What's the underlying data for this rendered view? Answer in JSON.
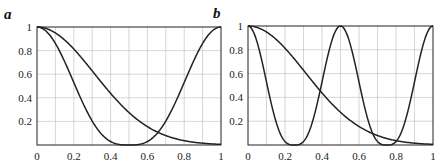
{
  "chart_data": [
    {
      "type": "line",
      "panel_label": "a",
      "xlim": [
        0,
        1
      ],
      "ylim": [
        0,
        1
      ],
      "xticks": [
        "0",
        "0.2",
        "0.4",
        "0.6",
        "0.8",
        "1"
      ],
      "yticks": [
        "0.2",
        "0.4",
        "0.6",
        "0.8",
        "1"
      ],
      "grid": true,
      "series": [
        {
          "name": "curve-gaussian",
          "x": [
            0,
            0.1,
            0.2,
            0.3,
            0.4,
            0.5,
            0.6,
            0.7,
            0.8,
            0.9,
            1.0
          ],
          "values": [
            1,
            0.95,
            0.81,
            0.63,
            0.44,
            0.27,
            0.16,
            0.08,
            0.04,
            0.02,
            0.01
          ]
        },
        {
          "name": "curve-periodic",
          "x": [
            0,
            0.1,
            0.2,
            0.3,
            0.4,
            0.5,
            0.6,
            0.7,
            0.8,
            0.9,
            1.0
          ],
          "values": [
            1,
            0.86,
            0.53,
            0.2,
            0.03,
            0,
            0.03,
            0.2,
            0.53,
            0.86,
            1
          ]
        }
      ]
    },
    {
      "type": "line",
      "panel_label": "b",
      "xlim": [
        0,
        1
      ],
      "ylim": [
        0,
        1
      ],
      "xticks": [
        "0",
        "0.2",
        "0.4",
        "0.6",
        "0.8",
        "1"
      ],
      "yticks": [
        "0.2",
        "0.4",
        "0.6",
        "0.8",
        "1"
      ],
      "grid": true,
      "series": [
        {
          "name": "curve-gaussian",
          "x": [
            0,
            0.1,
            0.2,
            0.3,
            0.4,
            0.5,
            0.6,
            0.7,
            0.8,
            0.9,
            1.0
          ],
          "values": [
            1,
            0.95,
            0.81,
            0.63,
            0.44,
            0.27,
            0.16,
            0.08,
            0.04,
            0.02,
            0.01
          ]
        },
        {
          "name": "curve-periodic",
          "x": [
            0,
            0.1,
            0.2,
            0.3,
            0.4,
            0.5,
            0.6,
            0.7,
            0.8,
            0.9,
            1.0
          ],
          "values": [
            1,
            0.2,
            0.03,
            0.03,
            0.53,
            1,
            0.53,
            0.03,
            0.03,
            0.53,
            1
          ]
        }
      ]
    }
  ],
  "panels": {
    "a": {
      "label": "a"
    },
    "b": {
      "label": "b"
    }
  }
}
